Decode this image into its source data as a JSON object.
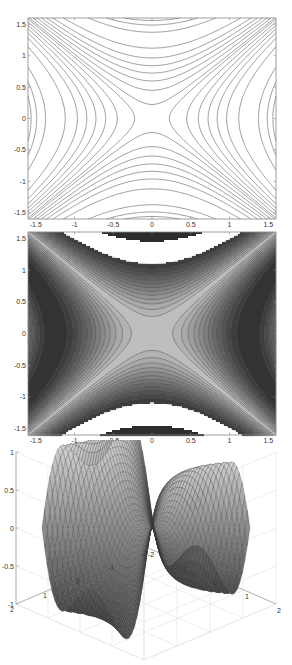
{
  "figure": {
    "colors": {
      "line": "#777777",
      "axis": "#888888",
      "grid": "#e2e2e2",
      "tick_text": "#333333"
    }
  },
  "chart_data": [
    {
      "type": "contour",
      "title": "",
      "xlabel": "",
      "ylabel": "",
      "xlim": [
        -1.6,
        1.6
      ],
      "ylim": [
        -1.6,
        1.6
      ],
      "x_ticks": [
        "-1.5",
        "-1",
        "-0.5",
        "0",
        "0.5",
        "1",
        "1.5"
      ],
      "y_ticks": [
        "1.5",
        "1",
        "0.5",
        "0",
        "-0.5",
        "-1",
        "-1.5"
      ],
      "x_tick_values": [
        -1.5,
        -1,
        -0.5,
        0,
        0.5,
        1,
        1.5
      ],
      "y_tick_values": [
        1.5,
        1,
        0.5,
        0,
        -0.5,
        -1,
        -1.5
      ],
      "function": "z = sin(x^2 - y^2)",
      "levels": [
        -0.95,
        -0.8,
        -0.65,
        -0.5,
        -0.35,
        -0.2,
        -0.05,
        0.05,
        0.2,
        0.35,
        0.5,
        0.65,
        0.8,
        0.95
      ],
      "grid": false
    },
    {
      "type": "heatmap",
      "subtype": "filled contour (grayscale)",
      "title": "",
      "xlim": [
        -1.6,
        1.6
      ],
      "ylim": [
        -1.6,
        1.6
      ],
      "x_ticks": [
        "-1.5",
        "-1",
        "-0.5",
        "0",
        "0.5",
        "1",
        "1.5"
      ],
      "y_ticks": [
        "1.5",
        "1",
        "0.5",
        "0",
        "-0.5",
        "-1",
        "-1.5"
      ],
      "x_tick_values": [
        -1.5,
        -1,
        -0.5,
        0,
        0.5,
        1,
        1.5
      ],
      "y_tick_values": [
        1.5,
        1,
        0.5,
        0,
        -0.5,
        -1,
        -1.5
      ],
      "function": "z = |sin(x^2 - y^2)|",
      "colormap": "gray (center light, outer dark, white gaps at |z| near 1 band on top/bottom)",
      "levels": 14,
      "grid": false
    },
    {
      "type": "surface",
      "title": "",
      "xlim": [
        -2,
        2
      ],
      "ylim": [
        -2,
        2
      ],
      "zlim": [
        -1,
        1
      ],
      "x_ticks": [
        "-2",
        "-1",
        "0",
        "1",
        "2"
      ],
      "y_ticks": [
        "2",
        "1",
        "0",
        "-1",
        "-2"
      ],
      "z_ticks": [
        "1",
        "0.5",
        "0",
        "-0.5",
        "-1"
      ],
      "z_tick_values": [
        1,
        0.5,
        0,
        -0.5,
        -1
      ],
      "colormap": "gray",
      "shading": "faceted mesh",
      "grid": true
    }
  ]
}
